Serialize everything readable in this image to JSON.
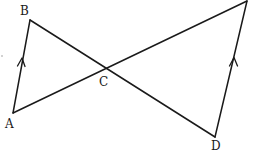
{
  "diagram": {
    "type": "geometry",
    "points": {
      "A": {
        "label": "A"
      },
      "B": {
        "label": "B"
      },
      "C": {
        "label": "C"
      },
      "D": {
        "label": "D"
      },
      "E": {
        "label": ""
      }
    },
    "segments": [
      {
        "id": "AB",
        "from": "A",
        "to": "B",
        "parallel_mark": true
      },
      {
        "id": "BD",
        "from": "B",
        "to": "D",
        "parallel_mark": false
      },
      {
        "id": "AE",
        "from": "A",
        "to": "E",
        "parallel_mark": false
      },
      {
        "id": "DE",
        "from": "D",
        "to": "E",
        "parallel_mark": true
      }
    ],
    "relations": [
      "AB ∥ DE",
      "BD and AE intersect at C"
    ],
    "stroke_color": "#1a1a1a"
  }
}
